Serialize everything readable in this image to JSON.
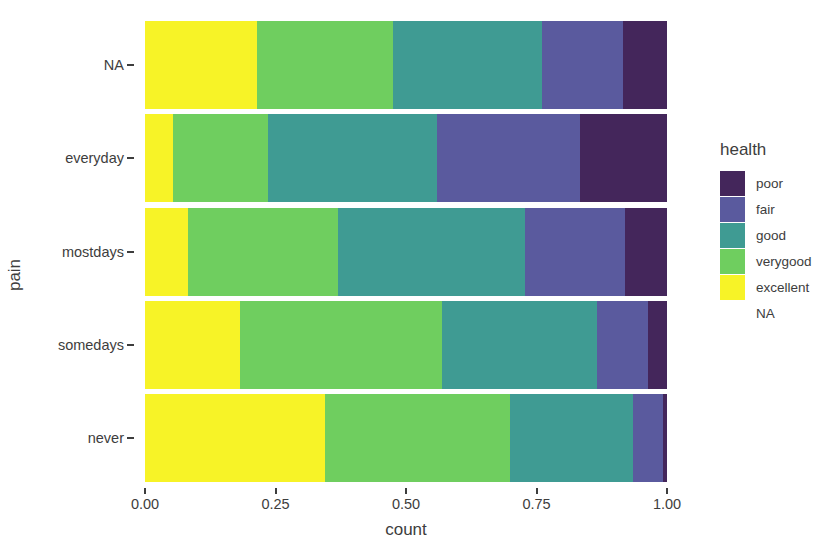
{
  "chart_data": {
    "type": "bar",
    "orientation": "horizontal",
    "stacked": true,
    "normalized": true,
    "title": "",
    "xlabel": "count",
    "ylabel": "pain",
    "xlim": [
      0,
      1
    ],
    "xticks": [
      0,
      0.25,
      0.5,
      0.75,
      1
    ],
    "xticklabels": [
      "0.00",
      "0.25",
      "0.50",
      "0.75",
      "1.00"
    ],
    "grid": false,
    "legend_title": "health",
    "legend_position": "right",
    "categories": [
      "NA",
      "everyday",
      "mostdays",
      "somedays",
      "never"
    ],
    "series": [
      {
        "name": "excellent",
        "color": "#F7F327",
        "values": [
          0.215,
          0.054,
          0.083,
          0.182,
          0.345
        ]
      },
      {
        "name": "verygood",
        "color": "#6FCE5F",
        "values": [
          0.26,
          0.182,
          0.287,
          0.387,
          0.354
        ]
      },
      {
        "name": "good",
        "color": "#3F9B93",
        "values": [
          0.285,
          0.323,
          0.358,
          0.297,
          0.236
        ]
      },
      {
        "name": "fair",
        "color": "#5A5A9E",
        "values": [
          0.156,
          0.274,
          0.192,
          0.098,
          0.058
        ]
      },
      {
        "name": "poor",
        "color": "#44265B",
        "values": [
          0.084,
          0.167,
          0.08,
          0.036,
          0.007
        ]
      }
    ]
  },
  "axes": {
    "y_title": "pain",
    "x_title": "count",
    "y_tick_labels": [
      "NA",
      "everyday",
      "mostdays",
      "somedays",
      "never"
    ],
    "x_tick_labels": [
      "0.00",
      "0.25",
      "0.50",
      "0.75",
      "1.00"
    ]
  },
  "legend": {
    "title": "health",
    "entries": [
      {
        "label": "poor",
        "color": "#44265B",
        "has_swatch": true
      },
      {
        "label": "fair",
        "color": "#5A5A9E",
        "has_swatch": true
      },
      {
        "label": "good",
        "color": "#3F9B93",
        "has_swatch": true
      },
      {
        "label": "verygood",
        "color": "#6FCE5F",
        "has_swatch": true
      },
      {
        "label": "excellent",
        "color": "#F7F327",
        "has_swatch": true
      },
      {
        "label": "NA",
        "color": "",
        "has_swatch": false
      }
    ]
  },
  "colors": {
    "background": "#FFFFFF",
    "text": "#3D3D3D",
    "poor": "#44265B",
    "fair": "#5A5A9E",
    "good": "#3F9B93",
    "verygood": "#6FCE5F",
    "excellent": "#F7F327"
  }
}
